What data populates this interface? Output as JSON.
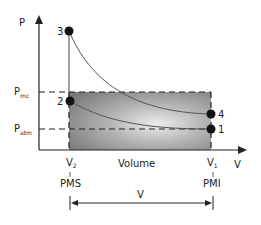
{
  "diagram": {
    "y_axis_label": "P",
    "x_axis_label": "V",
    "x_axis_title": "Volume",
    "pressure_levels": [
      {
        "main": "P",
        "sub": "mc"
      },
      {
        "main": "P",
        "sub": "atm"
      }
    ],
    "volume_marks": [
      {
        "main": "V",
        "sub": "2",
        "position_label": "PMS"
      },
      {
        "main": "V",
        "sub": "1",
        "position_label": "PMI"
      }
    ],
    "displacement_label": "V",
    "points": [
      "1",
      "2",
      "3",
      "4"
    ],
    "colors": {
      "axis": "#222222",
      "curve": "#555555",
      "shade_dark": "#7a7a7a",
      "shade_light": "#e6e6e6"
    }
  }
}
